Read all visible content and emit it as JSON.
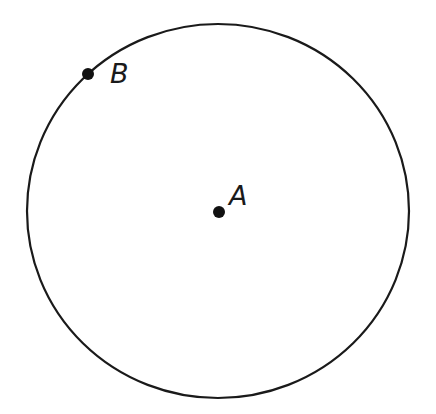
{
  "diagram": {
    "type": "geometry-circle",
    "circle": {
      "center": [
        218,
        211
      ],
      "radius_x": 191,
      "radius_y": 187,
      "stroke_color": "#1a1a1a",
      "stroke_width": 2.2
    },
    "points": [
      {
        "id": "A",
        "label": "A",
        "role": "center",
        "x": 219,
        "y": 212,
        "label_x": 229,
        "label_y": 182
      },
      {
        "id": "B",
        "label": "B",
        "role": "on-circle",
        "x": 88,
        "y": 74,
        "label_x": 110,
        "label_y": 60
      }
    ],
    "point_color": "#111111",
    "point_radius": 6
  }
}
